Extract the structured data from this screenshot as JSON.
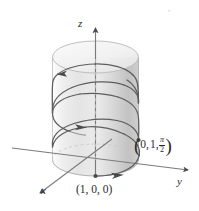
{
  "figure": {
    "background_color": "#ffffff",
    "axes": {
      "z_label": "z",
      "y_label": "y",
      "x_label": "x",
      "axis_color": "#6e6e6e"
    },
    "points": [
      {
        "id": "p1",
        "label": "(1, 0, 0)",
        "coordinates": [
          1,
          0,
          0
        ],
        "marker": "dot"
      },
      {
        "id": "p2",
        "label_open": "(",
        "label_x": "0,",
        "label_y": "1,",
        "label_z_num": "π",
        "label_z_den": "2",
        "label_close": ")",
        "label_plain": "(0, 1, π/2)",
        "coordinates": [
          0,
          1,
          1.5707963
        ],
        "marker": "dot"
      }
    ],
    "cylinder": {
      "fill_color": "#d6d6d6",
      "edge_color": "#b9b9b9",
      "radius": 1,
      "description": "translucent grey cylinder of radius 1 about the z-axis"
    },
    "helix": {
      "curve_color": "#5a5a5a",
      "description": "helix r(t) = (cos t, sin t, t) ascending around the cylinder",
      "arrow_count": 3,
      "arrow_directions": [
        "left",
        "right",
        "right"
      ]
    }
  }
}
